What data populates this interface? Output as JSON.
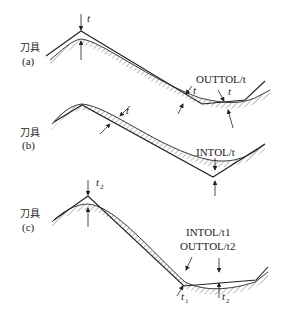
{
  "panels": [
    {
      "id": "a",
      "tool_label": "刀具",
      "panel_label": "(a)",
      "tolerance_label": "OUTTOL/t",
      "dimension_symbols": [
        "t",
        "t",
        "t"
      ]
    },
    {
      "id": "b",
      "tool_label": "刀具",
      "panel_label": "(b)",
      "tolerance_label": "INTOL/t",
      "dimension_symbols": [
        "t"
      ]
    },
    {
      "id": "c",
      "tool_label": "刀具",
      "panel_label": "(c)",
      "tolerance_label_line1": "INTOL/t1",
      "tolerance_label_line2": "OUTTOL/t2",
      "dimension_symbols": [
        "t",
        "t",
        "t"
      ],
      "subscripts": [
        "2",
        "1",
        "2"
      ]
    }
  ],
  "colors": {
    "line": "#222222",
    "hatch": "#555555",
    "background": "#ffffff"
  }
}
